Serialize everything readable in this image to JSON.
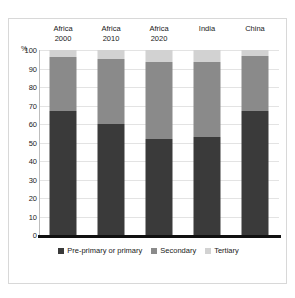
{
  "top_caption_remnant": "",
  "chart_data": {
    "type": "bar",
    "subtype": "stacked-100",
    "title": "",
    "xlabel": "",
    "ylabel": "%",
    "ylim": [
      0,
      100
    ],
    "ytick_step": 10,
    "grid": true,
    "legend_position": "bottom-center",
    "categories": [
      "Africa 2000",
      "Africa 2010",
      "Africa 2020",
      "India",
      "China"
    ],
    "category_lines": [
      {
        "line1": "Africa",
        "line2": "2000"
      },
      {
        "line1": "Africa",
        "line2": "2010"
      },
      {
        "line1": "Africa",
        "line2": "2020"
      },
      {
        "line1": "India",
        "line2": ""
      },
      {
        "line1": "China",
        "line2": ""
      }
    ],
    "yticks": [
      "100",
      "90",
      "80",
      "70",
      "60",
      "50",
      "40",
      "30",
      "20",
      "10",
      "0"
    ],
    "series": [
      {
        "name": "Pre-primary or primary",
        "color": "#3a3a3a",
        "values": [
          67,
          60,
          52,
          53,
          67
        ]
      },
      {
        "name": "Secondary",
        "color": "#8a8a8a",
        "values": [
          29,
          35,
          41.5,
          40.5,
          29.5
        ]
      },
      {
        "name": "Tertiary",
        "color": "#d2d2d2",
        "values": [
          4,
          5,
          6.5,
          6.5,
          3.5
        ]
      }
    ],
    "cumulative_tops": {
      "primary": [
        67,
        60,
        52,
        53,
        67
      ],
      "secondary": [
        96,
        95,
        93.5,
        93.5,
        96.5
      ],
      "tertiary": [
        100,
        100,
        100,
        100,
        100
      ]
    }
  },
  "legend": {
    "items": [
      {
        "label": "Pre-primary or primary",
        "color": "#3a3a3a"
      },
      {
        "label": "Secondary",
        "color": "#8a8a8a"
      },
      {
        "label": "Tertiary",
        "color": "#d2d2d2"
      }
    ]
  }
}
